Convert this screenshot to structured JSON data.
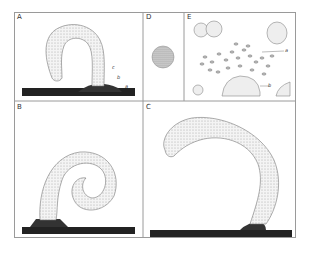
{
  "figure": {
    "panels": [
      {
        "id": "A",
        "label": "A",
        "annotations": [
          "c",
          "b",
          "a"
        ]
      },
      {
        "id": "B",
        "label": "B",
        "annotations": []
      },
      {
        "id": "C",
        "label": "C",
        "annotations": []
      },
      {
        "id": "D",
        "label": "D",
        "annotations": []
      },
      {
        "id": "E",
        "label": "E",
        "annotations": [
          "a",
          "b"
        ]
      }
    ]
  }
}
